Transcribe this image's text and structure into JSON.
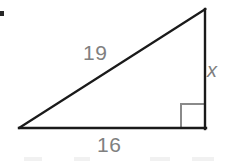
{
  "figure": {
    "canvas": {
      "width": 232,
      "height": 164,
      "background": "#ffffff"
    },
    "stroke_color": "#1a1a1a",
    "stroke_width": 2,
    "label_color": "#808080",
    "right_angle_color": "#8a8a8a",
    "vertices": {
      "left": {
        "x": 19,
        "y": 128
      },
      "bottom_right": {
        "x": 205,
        "y": 128
      },
      "apex": {
        "x": 205,
        "y": 9
      }
    },
    "labels": {
      "hypotenuse": "19",
      "vertical_leg": "x",
      "base": "16"
    },
    "right_angle_marker": {
      "name": "right-angle-square",
      "size": 24,
      "at_vertex": "bottom_right"
    }
  }
}
